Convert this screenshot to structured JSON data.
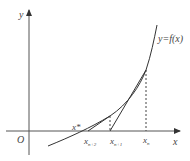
{
  "diagram": {
    "axes": {
      "x_label": "x",
      "y_label": "y",
      "origin_label": "O"
    },
    "curve_label": "y=f(x)",
    "points": {
      "root": "x*",
      "x_n": "x",
      "x_n_sub": "n",
      "x_n1": "x",
      "x_n1_sub": "n+1",
      "x_n2": "x",
      "x_n2_sub": "n+2"
    },
    "colors": {
      "line": "#333333",
      "axis": "#555555",
      "dashed": "#444444"
    }
  }
}
